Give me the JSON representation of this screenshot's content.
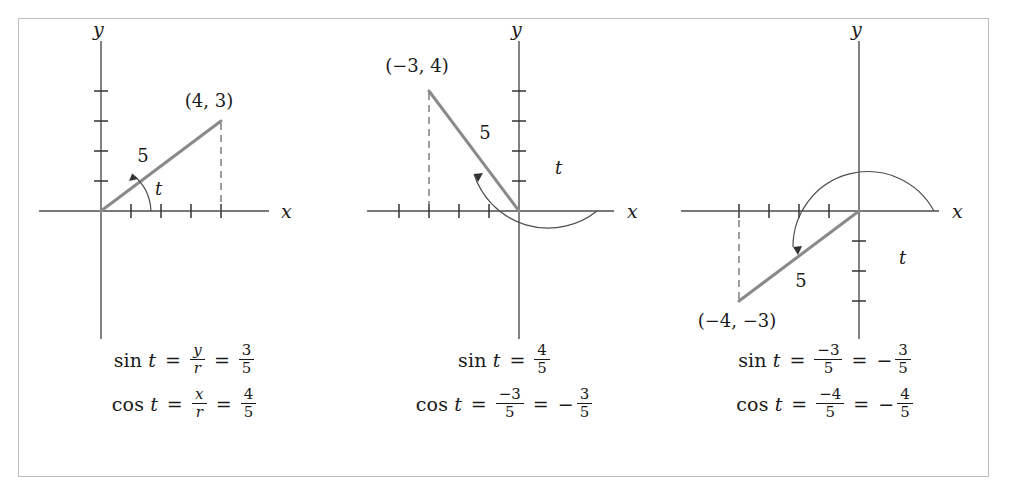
{
  "figure": {
    "panels": [
      {
        "id": "panel-1",
        "point_label": "(4, 3)",
        "radius_label": "5",
        "angle_label": "t",
        "x_axis_label": "x",
        "y_axis_label": "y",
        "point": {
          "x": 4,
          "y": 3
        },
        "radius": 5,
        "quadrant": 1,
        "x_ticks": [
          1,
          2,
          3,
          4
        ],
        "y_ticks": [
          1,
          2,
          3,
          4
        ],
        "formulas": [
          {
            "function": "sin",
            "variable": "t",
            "terms": [
              {
                "type": "fraction",
                "numerator": "y",
                "denominator": "r",
                "style": "italic"
              },
              {
                "type": "fraction",
                "numerator": "3",
                "denominator": "5",
                "style": "upright"
              }
            ]
          },
          {
            "function": "cos",
            "variable": "t",
            "terms": [
              {
                "type": "fraction",
                "numerator": "x",
                "denominator": "r",
                "style": "italic"
              },
              {
                "type": "fraction",
                "numerator": "4",
                "denominator": "5",
                "style": "upright"
              }
            ]
          }
        ]
      },
      {
        "id": "panel-2",
        "point_label": "(−3, 4)",
        "radius_label": "5",
        "angle_label": "t",
        "x_axis_label": "x",
        "y_axis_label": "y",
        "point": {
          "x": -3,
          "y": 4
        },
        "radius": 5,
        "quadrant": 2,
        "x_ticks": [
          -4,
          -3,
          -2,
          -1
        ],
        "y_ticks": [
          1,
          2,
          3,
          4
        ],
        "formulas": [
          {
            "function": "sin",
            "variable": "t",
            "terms": [
              {
                "type": "fraction",
                "numerator": "4",
                "denominator": "5",
                "style": "upright"
              }
            ]
          },
          {
            "function": "cos",
            "variable": "t",
            "terms": [
              {
                "type": "fraction",
                "numerator": "−3",
                "denominator": "5",
                "style": "upright"
              },
              {
                "type": "fraction",
                "numerator": "3",
                "denominator": "5",
                "style": "upright",
                "sign": "−"
              }
            ]
          }
        ]
      },
      {
        "id": "panel-3",
        "point_label": "(−4, −3)",
        "radius_label": "5",
        "angle_label": "t",
        "x_axis_label": "x",
        "y_axis_label": "y",
        "point": {
          "x": -4,
          "y": -3
        },
        "radius": 5,
        "quadrant": 3,
        "x_ticks": [
          -4,
          -3,
          -2,
          -1
        ],
        "y_ticks": [
          -1,
          -2,
          -3
        ],
        "formulas": [
          {
            "function": "sin",
            "variable": "t",
            "terms": [
              {
                "type": "fraction",
                "numerator": "−3",
                "denominator": "5",
                "style": "upright"
              },
              {
                "type": "fraction",
                "numerator": "3",
                "denominator": "5",
                "style": "upright",
                "sign": "−"
              }
            ]
          },
          {
            "function": "cos",
            "variable": "t",
            "terms": [
              {
                "type": "fraction",
                "numerator": "−4",
                "denominator": "5",
                "style": "upright"
              },
              {
                "type": "fraction",
                "numerator": "4",
                "denominator": "5",
                "style": "upright",
                "sign": "−"
              }
            ]
          }
        ]
      }
    ],
    "equals_sign": "=",
    "colors": {
      "ray": "#8a8a8a",
      "axis": "#4d4d4d",
      "text": "#1a1a1a",
      "border": "#bdbdbd"
    }
  }
}
